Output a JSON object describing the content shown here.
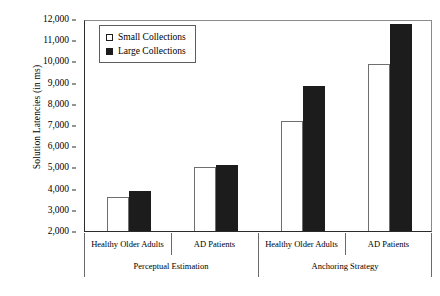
{
  "chart_data": {
    "type": "bar",
    "title": "",
    "xlabel": "",
    "ylabel": "Solution Latencies (in ms)",
    "ylim": [
      2000,
      12000
    ],
    "ytick_interval": 1000,
    "ytick_labels": [
      "2,000",
      "3,000",
      "4,000",
      "5,000",
      "6,000",
      "7,000",
      "8,000",
      "9,000",
      "10,000",
      "11,000",
      "12,000"
    ],
    "ytick_values": [
      2000,
      3000,
      4000,
      5000,
      6000,
      7000,
      8000,
      9000,
      10000,
      11000,
      12000
    ],
    "grid": false,
    "legend_position": "top-left",
    "categories": [
      "Healthy Older Adults",
      "AD Patients",
      "Healthy Older Adults",
      "AD Patients"
    ],
    "group_labels": [
      "Perceptual Estimation",
      "Anchoring Strategy"
    ],
    "group_spans": [
      2,
      2
    ],
    "series": [
      {
        "name": "Small Collections",
        "color": "#ffffff",
        "edge_color": "#6f6f6f",
        "values": [
          3600,
          5000,
          7200,
          9900
        ]
      },
      {
        "name": "Large Collections",
        "color": "#1c1c1c",
        "edge_color": "#1c1c1c",
        "values": [
          3900,
          5100,
          8850,
          11750
        ]
      }
    ]
  },
  "legend": {
    "items": [
      {
        "label": "Small Collections",
        "style": "small"
      },
      {
        "label": "Large Collections",
        "style": "large"
      }
    ]
  }
}
